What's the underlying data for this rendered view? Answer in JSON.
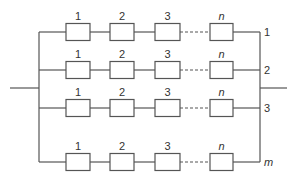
{
  "diagram": {
    "type": "parallel-series reliability block diagram",
    "component_labels": [
      "1",
      "2",
      "3",
      "n"
    ],
    "branch_labels": [
      "1",
      "2",
      "3",
      "m"
    ],
    "colors": {
      "line": "#555555",
      "text": "#333333",
      "background": "#ffffff"
    }
  }
}
